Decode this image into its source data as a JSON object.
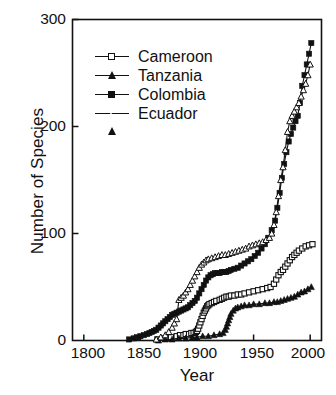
{
  "chart_data": {
    "type": "line",
    "title": "",
    "xlabel": "Year",
    "ylabel": "Number of Species",
    "xlim": [
      1790,
      2010
    ],
    "ylim": [
      0,
      300
    ],
    "xticks": [
      1800,
      1850,
      1900,
      1950,
      2000
    ],
    "yticks": [
      0,
      100,
      200,
      300
    ],
    "grid": false,
    "legend_position": "upper-left-inside",
    "series": [
      {
        "name": "Cameroon",
        "marker": "open-square",
        "x": [
          1865,
          1872,
          1877,
          1882,
          1885,
          1888,
          1890,
          1893,
          1895,
          1897,
          1899,
          1900,
          1901,
          1902,
          1903,
          1904,
          1905,
          1906,
          1907,
          1908,
          1909,
          1910,
          1911,
          1913,
          1915,
          1917,
          1920,
          1922,
          1924,
          1926,
          1928,
          1930,
          1933,
          1936,
          1939,
          1942,
          1946,
          1950,
          1954,
          1958,
          1962,
          1965,
          1968,
          1970,
          1972,
          1974,
          1976,
          1978,
          1980,
          1982,
          1984,
          1986,
          1988,
          1990,
          1993,
          1996,
          1999,
          2002
        ],
        "y": [
          1,
          2,
          3,
          4,
          5,
          5,
          6,
          6,
          7,
          7,
          8,
          9,
          11,
          14,
          17,
          20,
          23,
          26,
          28,
          30,
          32,
          33,
          34,
          35,
          36,
          37,
          38,
          39,
          40,
          41,
          41,
          42,
          42,
          43,
          43,
          44,
          45,
          46,
          47,
          48,
          49,
          50,
          53,
          57,
          61,
          64,
          66,
          69,
          72,
          75,
          78,
          80,
          82,
          84,
          86,
          88,
          89,
          90
        ]
      },
      {
        "name": "Tanzania",
        "marker": "filled-triangle",
        "x": [
          1866,
          1872,
          1878,
          1884,
          1890,
          1896,
          1900,
          1905,
          1910,
          1915,
          1920,
          1923,
          1925,
          1926,
          1927,
          1928,
          1929,
          1930,
          1932,
          1934,
          1936,
          1939,
          1942,
          1946,
          1950,
          1955,
          1960,
          1964,
          1968,
          1971,
          1974,
          1977,
          1980,
          1983,
          1986,
          1989,
          1992,
          1995,
          1998,
          2001
        ],
        "y": [
          0,
          1,
          1,
          2,
          2,
          3,
          3,
          4,
          4,
          5,
          6,
          7,
          10,
          13,
          16,
          19,
          22,
          25,
          28,
          30,
          31,
          32,
          33,
          33,
          34,
          34,
          35,
          35,
          36,
          36,
          37,
          38,
          39,
          40,
          41,
          43,
          45,
          46,
          48,
          50
        ]
      },
      {
        "name": "Colombia",
        "marker": "filled-square",
        "x": [
          1840,
          1844,
          1847,
          1850,
          1853,
          1856,
          1858,
          1860,
          1862,
          1864,
          1866,
          1868,
          1870,
          1872,
          1874,
          1876,
          1878,
          1880,
          1882,
          1884,
          1886,
          1888,
          1890,
          1892,
          1894,
          1896,
          1898,
          1900,
          1902,
          1904,
          1906,
          1908,
          1910,
          1912,
          1914,
          1916,
          1918,
          1920,
          1922,
          1924,
          1926,
          1928,
          1930,
          1933,
          1936,
          1939,
          1942,
          1945,
          1948,
          1951,
          1954,
          1957,
          1960,
          1963,
          1966,
          1969,
          1971,
          1973,
          1975,
          1977,
          1979,
          1981,
          1983,
          1985,
          1987,
          1989,
          1991,
          1993,
          1995,
          1997,
          1999,
          2001
        ],
        "y": [
          1,
          2,
          3,
          4,
          5,
          6,
          7,
          8,
          9,
          10,
          12,
          14,
          16,
          18,
          20,
          22,
          24,
          25,
          26,
          27,
          28,
          29,
          30,
          31,
          33,
          35,
          37,
          40,
          44,
          48,
          52,
          56,
          59,
          61,
          62,
          63,
          63,
          63,
          64,
          64,
          64,
          65,
          66,
          67,
          68,
          70,
          72,
          74,
          76,
          79,
          82,
          86,
          90,
          96,
          103,
          112,
          124,
          138,
          152,
          165,
          176,
          186,
          193,
          199,
          205,
          210,
          222,
          238,
          248,
          258,
          268,
          278
        ]
      },
      {
        "name": "Ecuador",
        "marker": "open-triangle",
        "x": [
          1864,
          1868,
          1872,
          1875,
          1878,
          1880,
          1882,
          1884,
          1886,
          1888,
          1890,
          1892,
          1894,
          1896,
          1898,
          1900,
          1902,
          1904,
          1906,
          1908,
          1910,
          1913,
          1916,
          1919,
          1922,
          1925,
          1928,
          1931,
          1934,
          1937,
          1940,
          1943,
          1946,
          1949,
          1952,
          1955,
          1958,
          1961,
          1964,
          1966,
          1968,
          1970,
          1972,
          1974,
          1976,
          1978,
          1980,
          1982,
          1984,
          1986,
          1988,
          1990,
          1992,
          1994,
          1996,
          1998,
          2000
        ],
        "y": [
          1,
          3,
          5,
          8,
          12,
          16,
          20,
          38,
          40,
          42,
          45,
          48,
          52,
          56,
          60,
          64,
          68,
          71,
          73,
          75,
          76,
          77,
          78,
          79,
          80,
          80,
          81,
          82,
          83,
          84,
          85,
          86,
          88,
          89,
          90,
          91,
          92,
          94,
          96,
          100,
          108,
          120,
          135,
          150,
          162,
          178,
          195,
          205,
          210,
          214,
          218,
          222,
          228,
          234,
          240,
          248,
          258
        ]
      }
    ]
  },
  "axes": {
    "yticklabels": [
      "300",
      "200",
      "100",
      "0"
    ],
    "xticklabels": [
      "1800",
      "1850",
      "1900",
      "1950",
      "2000"
    ]
  },
  "legend": {
    "items": [
      {
        "label": "Cameroon",
        "marker": "open-square"
      },
      {
        "label": "Tanzania",
        "marker": "filled-triangle"
      },
      {
        "label": "Colombia",
        "marker": "filled-square"
      },
      {
        "label": "Ecuador",
        "marker": "open-triangle"
      }
    ]
  }
}
